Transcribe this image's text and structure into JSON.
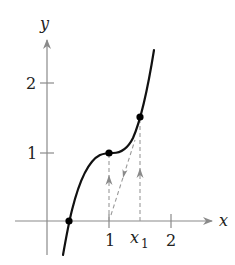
{
  "diagram": {
    "type": "function-graph",
    "axes": {
      "x_label": "x",
      "y_label": "y",
      "x_ticks": [
        {
          "value": 1,
          "label": "1"
        },
        {
          "value": 2,
          "label": "2"
        }
      ],
      "x1_label": "x",
      "x1_subscript": "1",
      "y_ticks": [
        {
          "value": 1,
          "label": "1"
        },
        {
          "value": 2,
          "label": "2"
        }
      ]
    },
    "points": [
      {
        "name": "root",
        "x": 0.35,
        "y": 0
      },
      {
        "name": "inflection",
        "x": 1,
        "y": 1
      },
      {
        "name": "x1-point",
        "x": 1.5,
        "y": 1.5
      }
    ],
    "colors": {
      "curve": "#111111",
      "axis": "#8a8a8a",
      "dashed": "#9a9a9a",
      "point": "#000000"
    }
  }
}
